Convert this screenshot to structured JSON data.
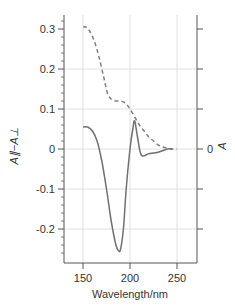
{
  "chart_data": {
    "type": "line",
    "title": "",
    "xlabel": "Wavelength/nm",
    "ylabel": "A∥−A⊥",
    "ylabel_right": "A",
    "xlim": [
      150,
      250
    ],
    "ylim": [
      -0.27,
      0.33
    ],
    "x_ticks": [
      "150",
      "200",
      "250"
    ],
    "y_ticks": [
      "0.3",
      "0.2",
      "0.1",
      "0",
      "-0.1",
      "-0.2"
    ],
    "y_right_ticks": [
      "0"
    ],
    "grid": true,
    "series": [
      {
        "name": "Linear dichroism (A∥−A⊥)",
        "style": "solid",
        "x": [
          150,
          155,
          160,
          165,
          170,
          175,
          180,
          185,
          188,
          190,
          193,
          196,
          200,
          203,
          205,
          208,
          212,
          220,
          230,
          240,
          245
        ],
        "values": [
          0.055,
          0.055,
          0.045,
          0.02,
          -0.03,
          -0.1,
          -0.18,
          -0.24,
          -0.255,
          -0.25,
          -0.2,
          -0.1,
          0.0,
          0.05,
          0.07,
          0.03,
          -0.015,
          -0.012,
          -0.008,
          0.0,
          0.0
        ]
      },
      {
        "name": "Absorbance (A)",
        "style": "dashed",
        "x": [
          150,
          153,
          157,
          162,
          167,
          172,
          176,
          180,
          185,
          190,
          195,
          200,
          205,
          210,
          215,
          220,
          225,
          230,
          235,
          240,
          245,
          250
        ],
        "values": [
          0.305,
          0.305,
          0.295,
          0.27,
          0.23,
          0.18,
          0.14,
          0.125,
          0.12,
          0.12,
          0.115,
          0.1,
          0.08,
          0.06,
          0.045,
          0.03,
          0.02,
          0.01,
          0.005,
          0.002,
          0.0,
          0.0
        ]
      }
    ]
  }
}
